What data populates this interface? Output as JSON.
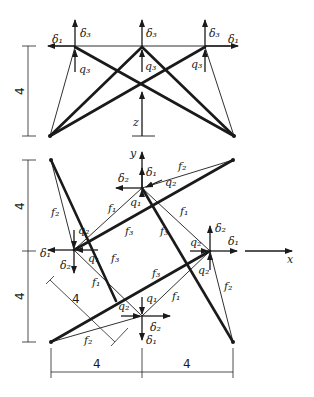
{
  "diagram": {
    "top_view": {
      "height_dim": "4",
      "labels": {
        "d1_left": "δ₁",
        "d3_left": "δ₃",
        "d3_mid": "δ₃",
        "d3_right": "δ₃",
        "d1_right": "δ₁",
        "q3_left": "q₃",
        "q3_mid": "q₃",
        "q3_right": "q₃",
        "z_axis": "z"
      }
    },
    "plan_view": {
      "dims": {
        "left_upper": "4",
        "left_lower": "4",
        "bottom_left": "4",
        "bottom_right": "4",
        "diag": "4"
      },
      "axes": {
        "y": "y",
        "x": "x"
      },
      "labels": {
        "top_d2": "δ₂",
        "top_d1": "δ₁",
        "top_q2": "q₂",
        "top_q1": "q₁",
        "top_f2": "f₂",
        "left_f2": "f₂",
        "left_q2": "q₂",
        "left_d1": "δ₁",
        "left_q1": "q₁",
        "left_d2": "δ₂",
        "f1_a": "f₁",
        "f3_a": "f₃",
        "f1_b": "f₁",
        "f3_b": "f₃",
        "f3_c": "f₃",
        "right_d2": "δ₂",
        "right_d1": "δ₁",
        "right_q2": "q₂",
        "right_q2b": "q₂",
        "right_f2": "f₂",
        "bot_q1": "q₁",
        "bot_q2": "q₂",
        "bot_d2": "δ₂",
        "bot_d1": "δ₁",
        "bot_f2": "f₂",
        "f1_c": "f₁",
        "f1_d": "f₁",
        "f3_d": "f₃"
      }
    }
  }
}
